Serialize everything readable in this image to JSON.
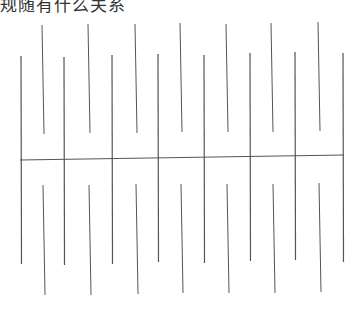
{
  "caption": "规随有什么关系",
  "diagram": {
    "stroke_color": "#555555",
    "baseline": {
      "x1": 20,
      "y1": 160,
      "x2": 344,
      "y2": 155
    },
    "long_lines": [
      {
        "x": 21,
        "y1": 56,
        "y2": 264
      },
      {
        "x": 64,
        "y1": 57,
        "y2": 265
      },
      {
        "x": 112,
        "y1": 55,
        "y2": 264
      },
      {
        "x": 158,
        "y1": 54,
        "y2": 262
      },
      {
        "x": 204,
        "y1": 55,
        "y2": 263
      },
      {
        "x": 250,
        "y1": 53,
        "y2": 261
      },
      {
        "x": 295,
        "y1": 52,
        "y2": 260
      },
      {
        "x": 343,
        "y1": 53,
        "y2": 262
      }
    ],
    "upper_short_lines": [
      {
        "x1": 42,
        "y1": 25,
        "x2": 44,
        "y2": 134
      },
      {
        "x1": 88,
        "y1": 24,
        "x2": 90,
        "y2": 133
      },
      {
        "x1": 135,
        "y1": 24,
        "x2": 137,
        "y2": 133
      },
      {
        "x1": 180,
        "y1": 23,
        "x2": 182,
        "y2": 132
      },
      {
        "x1": 226,
        "y1": 24,
        "x2": 228,
        "y2": 132
      },
      {
        "x1": 271,
        "y1": 23,
        "x2": 273,
        "y2": 132
      },
      {
        "x1": 318,
        "y1": 22,
        "x2": 320,
        "y2": 131
      }
    ],
    "lower_short_lines": [
      {
        "x1": 43,
        "y1": 185,
        "x2": 45,
        "y2": 295
      },
      {
        "x1": 89,
        "y1": 185,
        "x2": 91,
        "y2": 295
      },
      {
        "x1": 136,
        "y1": 184,
        "x2": 138,
        "y2": 294
      },
      {
        "x1": 181,
        "y1": 184,
        "x2": 183,
        "y2": 293
      },
      {
        "x1": 227,
        "y1": 184,
        "x2": 229,
        "y2": 293
      },
      {
        "x1": 273,
        "y1": 184,
        "x2": 275,
        "y2": 293
      },
      {
        "x1": 319,
        "y1": 183,
        "x2": 321,
        "y2": 292
      }
    ]
  }
}
